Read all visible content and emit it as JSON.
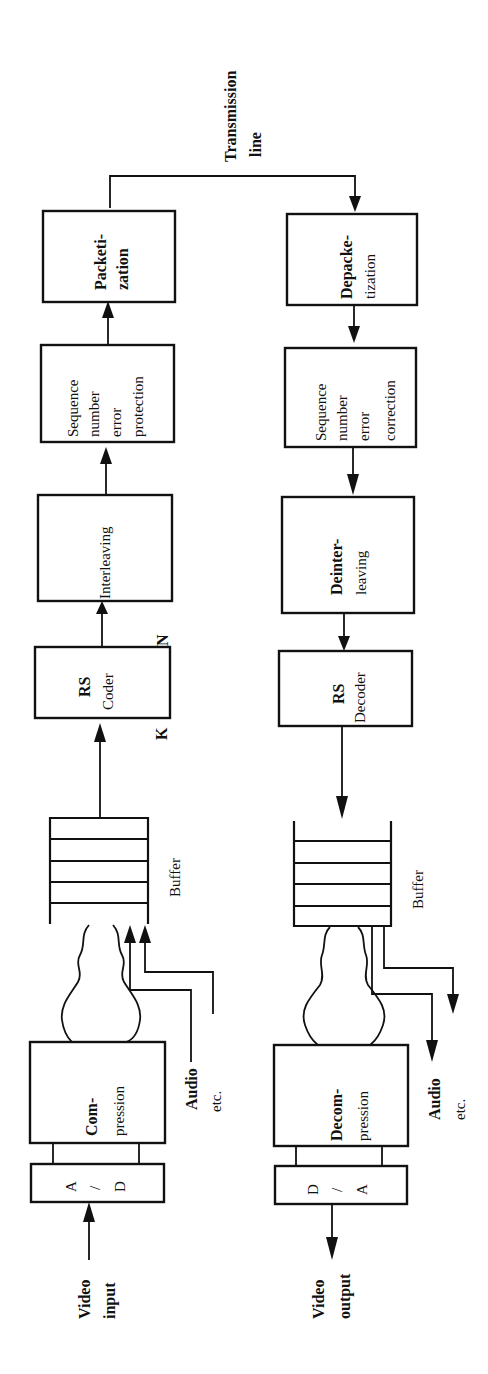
{
  "diagram": {
    "orientation": "rotated 90° counter-clockwise (reads bottom-to-top)",
    "transmission_line": {
      "line1": "Transmission",
      "line2": "line"
    },
    "transmitter": {
      "video_input": {
        "line1": "Video",
        "line2": "input"
      },
      "ad": {
        "top": "A",
        "mid": "/",
        "bottom": "D"
      },
      "compression": {
        "line1": "Com-",
        "line2": "pression"
      },
      "audio": {
        "line1": "Audio",
        "line2": "etc."
      },
      "buffer": "Buffer",
      "rs_coder": {
        "line1": "RS",
        "line2": "Coder"
      },
      "k_label": "K",
      "n_label": "N",
      "interleaving": "Interleaving",
      "seq_protect": {
        "line1": "Sequence",
        "line2": "number",
        "line3": "error",
        "line4": "protection"
      },
      "packetization": {
        "line1": "Packeti-",
        "line2": "zation"
      }
    },
    "receiver": {
      "depacketization": {
        "line1": "Depacke-",
        "line2": "tization"
      },
      "seq_correct": {
        "line1": "Sequence",
        "line2": "number",
        "line3": "error",
        "line4": "correction"
      },
      "deinterleaving": {
        "line1": "Deinter-",
        "line2": "leaving"
      },
      "rs_decoder": {
        "line1": "RS",
        "line2": "Decoder"
      },
      "buffer": "Buffer",
      "decompression": {
        "line1": "Decom-",
        "line2": "pression"
      },
      "audio": {
        "line1": "Audio",
        "line2": "etc."
      },
      "da": {
        "top": "D",
        "mid": "/",
        "bottom": "A"
      },
      "video_output": {
        "line1": "Video",
        "line2": "output"
      }
    }
  }
}
